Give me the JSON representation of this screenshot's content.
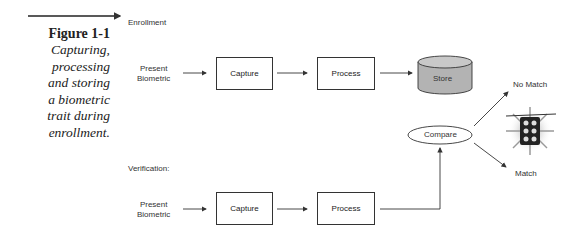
{
  "figure": {
    "number": "Figure 1-1",
    "caption_lines": [
      "Capturing,",
      "processing",
      "and storing",
      "a biometric",
      "trait during",
      "enrollment."
    ]
  },
  "enrollment": {
    "label": "Enrollment",
    "input": [
      "Present",
      "Biometric"
    ],
    "capture": "Capture",
    "process": "Process",
    "store": "Store"
  },
  "verification": {
    "label": "Verification:",
    "input": [
      "Present",
      "Biometric"
    ],
    "capture": "Capture",
    "process": "Process",
    "compare": "Compare"
  },
  "outcomes": {
    "no_match": "No Match",
    "match": "Match",
    "icon": "traffic-light-icon"
  },
  "colors": {
    "store_fill": "#b3b3b3",
    "line": "#333333"
  }
}
